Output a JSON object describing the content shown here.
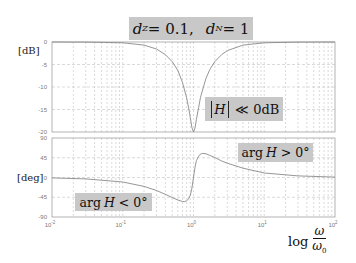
{
  "chart_data": [
    {
      "type": "line",
      "panel": "magnitude",
      "title": "d_Z = 0.1,   d_N = 1",
      "xlabel": "log ω/ω0",
      "ylabel": "[dB]",
      "xscale": "log",
      "xlim": [
        0.01,
        100
      ],
      "ylim": [
        -20,
        0
      ],
      "yticks": [
        0,
        -5,
        -10,
        -15,
        -20
      ],
      "xticks": [
        "10^-2",
        "10^-1",
        "10^0",
        "10^1",
        "10^2"
      ],
      "grid": true,
      "series": [
        {
          "name": "|H|",
          "x": [
            0.01,
            0.03,
            0.1,
            0.2,
            0.3,
            0.4,
            0.5,
            0.6,
            0.7,
            0.8,
            0.85,
            0.9,
            0.95,
            1.0,
            1.05,
            1.1,
            1.18,
            1.25,
            1.4,
            1.5,
            1.7,
            2.0,
            2.5,
            3.0,
            5.0,
            10.0,
            30.0,
            100.0
          ],
          "values": [
            0.0,
            -0.02,
            -0.17,
            -0.68,
            -1.55,
            -2.8,
            -4.36,
            -6.3,
            -9.0,
            -12.4,
            -14.5,
            -16.8,
            -19.0,
            -20.0,
            -19.1,
            -17.2,
            -14.6,
            -12.4,
            -9.7,
            -8.06,
            -6.1,
            -4.36,
            -2.8,
            -1.91,
            -0.68,
            -0.17,
            -0.02,
            0.0
          ]
        }
      ],
      "annotations": [
        "|H| ≪ 0dB"
      ]
    },
    {
      "type": "line",
      "panel": "phase",
      "xlabel": "log ω/ω0",
      "ylabel": "[deg]",
      "xscale": "log",
      "xlim": [
        0.01,
        100
      ],
      "ylim": [
        -90,
        90
      ],
      "yticks": [
        90,
        45,
        0,
        -45,
        -90
      ],
      "xticks": [
        "10^-2",
        "10^-1",
        "10^0",
        "10^1",
        "10^2"
      ],
      "grid": true,
      "series": [
        {
          "name": "arg H",
          "x": [
            0.01,
            0.03,
            0.1,
            0.2,
            0.3,
            0.4,
            0.5,
            0.6,
            0.7,
            0.75,
            0.8,
            0.85,
            0.9,
            0.95,
            1.0,
            1.05,
            1.1,
            1.18,
            1.25,
            1.35,
            1.5,
            1.7,
            2.0,
            2.5,
            3.0,
            5.0,
            10.0,
            30.0,
            100.0
          ],
          "values": [
            -1.0,
            -3.1,
            -10.3,
            -20.2,
            -29.6,
            -38.2,
            -45.5,
            -51.2,
            -54.7,
            -55.0,
            -53.4,
            -48.8,
            -40.5,
            -24.3,
            0.0,
            23.2,
            38.3,
            48.5,
            53.3,
            55.0,
            53.9,
            50.3,
            45.5,
            37.6,
            32.6,
            21.2,
            10.3,
            3.6,
            1.0
          ]
        }
      ],
      "annotations": [
        "arg H > 0°",
        "arg H < 0°"
      ]
    }
  ],
  "title": {
    "d_z": "d",
    "z_sub": "Z",
    "d_z_value": " = 0.1,",
    "d_n": "d",
    "n_sub": "N",
    "d_n_value": " = 1"
  },
  "axes": {
    "mag_ylabel": "[dB]",
    "phase_ylabel": "[deg]",
    "mag_yticks": [
      "0",
      "-5",
      "-10",
      "-15",
      "-20"
    ],
    "phase_yticks": [
      "90",
      "45",
      "0",
      "-45",
      "-90"
    ],
    "xtick_base": "10",
    "xtick_exps": [
      "-2",
      "-1",
      "0",
      "1",
      "2"
    ],
    "xlabel_log": "log",
    "xlabel_num": "ω",
    "xlabel_den": "ω",
    "xlabel_den_sub": "0"
  },
  "annotations": {
    "mag_H": "H",
    "mag_rel": "≪ 0dB",
    "pos_arg": "arg ",
    "pos_H": "H",
    "pos_rel": " > 0°",
    "neg_arg": "arg ",
    "neg_H": "H",
    "neg_rel": " < 0°"
  },
  "colors": {
    "curve": "#8a8a8a",
    "grid": "#b4b4b4",
    "frame": "#a0a0a0",
    "annotation_bg": "#c8c8c8"
  }
}
